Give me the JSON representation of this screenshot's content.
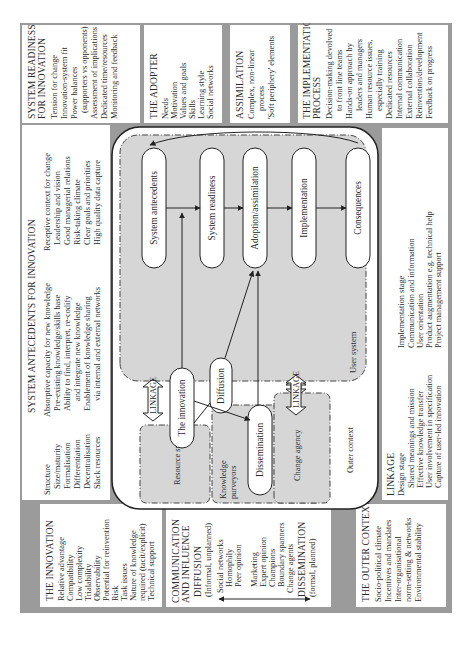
{
  "colors": {
    "frame": "#9b9b9b",
    "shaded": "#d6d6d6",
    "box": "#ffffff",
    "line": "#222222"
  },
  "innovation": {
    "title": "THE INNOVATION",
    "items": [
      "Relative advantage",
      "Compatibility",
      "Low complexity",
      "Trialability",
      "Observability",
      "Potential for reinvention",
      "Risk",
      "Task issues",
      "Nature of knowledge",
      "required (tacit/explicit)",
      "Technical support"
    ]
  },
  "communication": {
    "title1": "COMMUNICATION",
    "title2": "AND INFLUENCE",
    "diffusion": "DIFFUSION",
    "diffusion_sub": "(Informal, unplanned)",
    "items": [
      "Social networks",
      "Homophily",
      "Peer opinion",
      "Marketing",
      "Expert opinion",
      "Champions",
      "Boundary spanners",
      "Change agents"
    ],
    "dissemination": "DISSEMINATION",
    "dissemination_sub": "(formal, planned)"
  },
  "outer_context_box": {
    "title": "THE OUTER CONTEXT",
    "items": [
      "Socio-political climate",
      "Incentives and mandates",
      "Inter-organisational",
      "norm-setting & networks",
      "Environmental stability"
    ]
  },
  "system_antecedents": {
    "title": "SYSTEM ANTECEDENTS FOR INNOVATION",
    "col1": [
      "Structure",
      "Size/maturity",
      "Formalisation",
      "Differentiation",
      "Decentralisation",
      "Slack resources"
    ],
    "col2": [
      "Absorptive capacity for new knowledge",
      "Pre-existing knowledge/skills base",
      "Ability to find, interpret, re-codify",
      "and integrate new knowledge",
      "Enablement of knowledge sharing",
      "via internal and external networks"
    ],
    "col3": [
      "Receptive context for change",
      "Leadership and vision",
      "Good managerial relations",
      "Risk-taking climate",
      "Clear goals and priorities",
      "High quality data capture"
    ]
  },
  "system_readiness": {
    "title1": "SYSTEM READINESS",
    "title2": "FOR INNOVATION",
    "items": [
      "Tension for change",
      "Innovation-system fit",
      "Power balances",
      "(supporters vs opponents)",
      "Assessment of implications",
      "Dedicated time/resources",
      "Monitoring and feedback"
    ]
  },
  "adopter": {
    "title": "THE ADOPTER",
    "items": [
      "Needs",
      "Motivation",
      "Values and goals",
      "Skills",
      "Learning style",
      "Social networks"
    ]
  },
  "assimilation": {
    "title": "ASSIMILATION",
    "items": [
      "Complex, non-linear",
      "process",
      "'Soft periphery' elements"
    ]
  },
  "implementation_process": {
    "title1": "THE IMPLEMENTATION",
    "title2": "PROCESS",
    "items": [
      "Decision-making devolved",
      "to front line teams",
      "Hands-on approach by",
      "leaders and managers",
      "Human resource issues,",
      "especially training",
      "Dedicated resources",
      "Internal communication",
      "External collaboration",
      "Reinvention/development",
      "Feedback on progress"
    ]
  },
  "linkage_box": {
    "title": "LINKAGE",
    "design_stage": "Design stage",
    "design_items": [
      "Shared meanings and mission",
      "Effective knowledge transfer",
      "User involvement in specification",
      "Capture of user-led innovation"
    ],
    "implementation_stage": "Implementation stage",
    "implementation_items": [
      "Communication and information",
      "User orientation",
      "Product augmentation e.g. technical help",
      "Project management support"
    ]
  },
  "diagram": {
    "user_system": "User system",
    "outer_context": "Outer context",
    "resource_system": "Resource system",
    "knowledge_purveyors_1": "Knowledge",
    "knowledge_purveyors_2": "purveyors",
    "change_agency": "Change agency",
    "linkage_1": "LINKAGE",
    "linkage_2": "LINKAGE",
    "nodes": {
      "system_antecedents": "System antecedents",
      "system_readiness": "System readiness",
      "adoption": "Adoption/assimilation",
      "implementation": "Implementation",
      "consequences": "Consequences",
      "innovation": "The innovation",
      "diffusion": "Diffusion",
      "dissemination": "Dissemination"
    }
  }
}
